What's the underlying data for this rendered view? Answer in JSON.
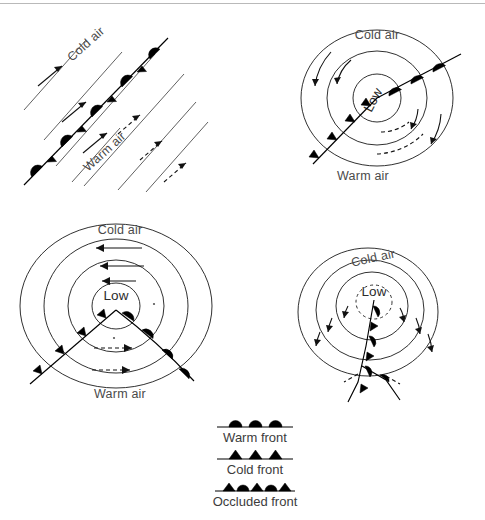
{
  "figure": {
    "width": 485,
    "height": 520,
    "background": "#ffffff",
    "rule_color": "#b9b9b9"
  },
  "colors": {
    "ink": "#000000",
    "label": "#4a4a4a",
    "isobar": "#1a1a1a",
    "flowline": "#4f4f4f",
    "legend_text": "#3c3c3c"
  },
  "panels": [
    {
      "id": "stage-1-stationary-front",
      "position": "top-left",
      "labels": {
        "cold_air": "Cold air",
        "warm_air": "Warm air"
      },
      "front_type": "stationary",
      "description": "Stationary front between cold air aloft-left and warm air lower-right, with opposing parallel airflow",
      "cold_flow_arrows": 3,
      "warm_flow_arrows": 3,
      "cold_arrow_style": "solid",
      "warm_arrow_style": "dashed",
      "symbol_pairs": 5
    },
    {
      "id": "stage-2-wave-cyclone",
      "position": "top-right",
      "labels": {
        "cold_air": "Cold air",
        "warm_air": "Warm air",
        "low": "Low"
      },
      "front_type": "frontal-wave",
      "description": "Incipient wave on the front with a developing low centre; cold front trailing southwest, warm front extending northeast",
      "isobar_count": 3,
      "cold_arrow_style": "solid",
      "warm_arrow_style": "dashed"
    },
    {
      "id": "stage-3-open-wave",
      "position": "bottom-left",
      "labels": {
        "cold_air": "Cold air",
        "warm_air": "Warm air",
        "low": "Low"
      },
      "front_type": "open-wave",
      "description": "Mature open wave cyclone with a well defined warm sector between the cold front and warm front",
      "isobar_count": 4,
      "cold_arrow_style": "solid",
      "warm_arrow_style": "dashed"
    },
    {
      "id": "stage-4-occlusion",
      "position": "bottom-right",
      "labels": {
        "cold_air": "Cold air",
        "low": "Low"
      },
      "front_type": "occluded",
      "description": "Occluded stage: the cold front has overtaken the warm front, lifting the warm sector off the surface",
      "isobar_count": 4,
      "cold_arrow_style": "solid"
    }
  ],
  "legend": {
    "items": [
      {
        "symbol": "warm-front",
        "label": "Warm front"
      },
      {
        "symbol": "cold-front",
        "label": "Cold front"
      },
      {
        "symbol": "occluded-front",
        "label": "Occluded front"
      }
    ]
  }
}
